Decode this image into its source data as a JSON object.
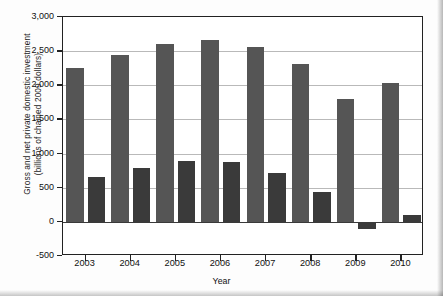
{
  "chart_data": {
    "type": "bar",
    "title": "",
    "xlabel": "Year",
    "ylabel": "Gross and net private domestic investment (billions of  chained 2009 dollars)",
    "ylabel_line1": "Gross and net private domestic investment",
    "ylabel_line2": "(billions of  chained 2009 dollars)",
    "categories": [
      "2003",
      "2004",
      "2005",
      "2006",
      "2007",
      "2008",
      "2009",
      "2010"
    ],
    "series": [
      {
        "name": "Gross private domestic investment",
        "color": "#555555",
        "values": [
          2250,
          2450,
          2600,
          2670,
          2560,
          2310,
          1805,
          2040
        ]
      },
      {
        "name": "Net private domestic investment",
        "color": "#3a3a3a",
        "values": [
          650,
          795,
          895,
          880,
          710,
          435,
          -100,
          105
        ]
      }
    ],
    "ylim": [
      -500,
      3000
    ],
    "ytick_values": [
      -500,
      0,
      500,
      1000,
      1500,
      2000,
      2500,
      3000
    ],
    "ytick_labels": [
      "-500",
      "0",
      "500",
      "1,000",
      "1,500",
      "2,000",
      "2,500",
      "3,000"
    ],
    "grid": true,
    "legend": "none",
    "zero_line": 0
  },
  "colors": {
    "gross_bar": "#555555",
    "net_bar": "#3a3a3a",
    "gridline": "#b9b9b9",
    "axis": "#222222",
    "plot_background": "#ffffff",
    "figure_background": "#fdfdfd"
  }
}
